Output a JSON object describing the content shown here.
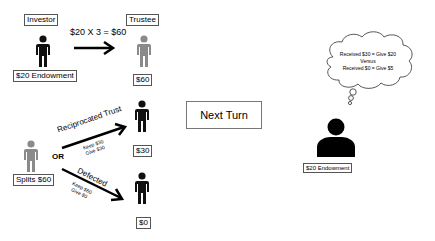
{
  "top_row": {
    "investor_label": "Investor",
    "trustee_label": "Trustee",
    "transfer_equation": "$20 X 3 = $60",
    "investor_endowment": "$20 Endowment",
    "trustee_amount": "$60"
  },
  "bottom_row": {
    "splitter_label": "Splits $60",
    "or_label": "OR",
    "reciprocated": {
      "label": "Reciprocated Trust",
      "keep": "Keep $30",
      "give": "Give $30",
      "result": "$30"
    },
    "defected": {
      "label": "Defected",
      "keep": "Keep $60",
      "give": "Give $0",
      "result": "$0"
    }
  },
  "center": {
    "next_turn_label": "Next Turn"
  },
  "right": {
    "thought_line1": "Received $30 = Give $20",
    "thought_versus": "Versus",
    "thought_line2": "Received $0 = Give $5",
    "endowment": "$20 Endowment"
  },
  "colors": {
    "person_dark": "#111111",
    "person_gray": "#8a8a8a"
  }
}
